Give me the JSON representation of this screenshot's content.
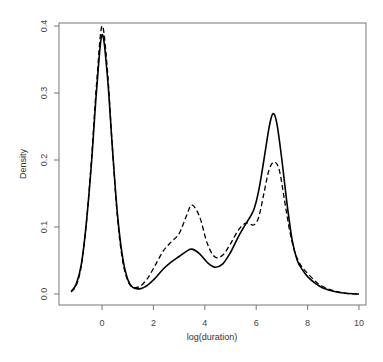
{
  "chart_data": {
    "type": "line",
    "title": "",
    "xlabel": "log(duration)",
    "ylabel": "Density",
    "xlim": [
      -1.65,
      10.3
    ],
    "ylim": [
      -0.016,
      0.405
    ],
    "x_ticks": [
      0,
      2,
      4,
      6,
      8,
      10
    ],
    "x_tick_labels": [
      "0",
      "2",
      "4",
      "6",
      "8",
      "10"
    ],
    "y_ticks": [
      0.0,
      0.1,
      0.2,
      0.3,
      0.4
    ],
    "y_tick_labels": [
      "0.0",
      "0.1",
      "0.2",
      "0.3",
      "0.4"
    ],
    "grid": false,
    "legend": null,
    "series": [
      {
        "name": "solid",
        "style": "solid",
        "color": "#000000",
        "x": [
          -1.2,
          -1.0,
          -0.8,
          -0.6,
          -0.4,
          -0.2,
          0.0,
          0.2,
          0.4,
          0.6,
          0.8,
          1.0,
          1.2,
          1.5,
          1.8,
          2.1,
          2.4,
          2.7,
          3.0,
          3.3,
          3.5,
          3.8,
          4.1,
          4.4,
          4.7,
          5.0,
          5.3,
          5.6,
          5.9,
          6.1,
          6.3,
          6.5,
          6.65,
          6.8,
          7.0,
          7.2,
          7.4,
          7.6,
          7.8,
          8.0,
          8.3,
          8.6,
          9.0,
          9.5,
          10.0
        ],
        "values": [
          0.004,
          0.015,
          0.045,
          0.11,
          0.2,
          0.31,
          0.387,
          0.33,
          0.22,
          0.12,
          0.055,
          0.022,
          0.01,
          0.008,
          0.014,
          0.025,
          0.038,
          0.048,
          0.056,
          0.064,
          0.067,
          0.06,
          0.047,
          0.04,
          0.045,
          0.062,
          0.085,
          0.105,
          0.125,
          0.155,
          0.2,
          0.248,
          0.269,
          0.255,
          0.2,
          0.135,
          0.08,
          0.05,
          0.036,
          0.026,
          0.016,
          0.009,
          0.004,
          0.001,
          0.0
        ]
      },
      {
        "name": "dashed",
        "style": "dashed",
        "color": "#000000",
        "x": [
          -1.2,
          -1.0,
          -0.8,
          -0.6,
          -0.4,
          -0.2,
          0.0,
          0.2,
          0.4,
          0.6,
          0.8,
          1.0,
          1.2,
          1.5,
          1.8,
          2.1,
          2.4,
          2.7,
          3.0,
          3.3,
          3.5,
          3.8,
          4.1,
          4.4,
          4.7,
          5.0,
          5.3,
          5.6,
          5.9,
          6.1,
          6.3,
          6.5,
          6.7,
          6.9,
          7.1,
          7.3,
          7.5,
          7.7,
          7.9,
          8.2,
          8.5,
          9.0,
          9.5,
          10.0
        ],
        "values": [
          0.003,
          0.013,
          0.043,
          0.11,
          0.205,
          0.32,
          0.4,
          0.34,
          0.22,
          0.115,
          0.05,
          0.02,
          0.01,
          0.012,
          0.025,
          0.045,
          0.065,
          0.078,
          0.09,
          0.118,
          0.133,
          0.115,
          0.075,
          0.055,
          0.058,
          0.075,
          0.095,
          0.106,
          0.103,
          0.115,
          0.15,
          0.185,
          0.197,
          0.185,
          0.14,
          0.095,
          0.063,
          0.045,
          0.035,
          0.023,
          0.013,
          0.005,
          0.001,
          0.0
        ]
      }
    ]
  },
  "axes": {
    "xlabel": "log(duration)",
    "ylabel": "Density"
  }
}
